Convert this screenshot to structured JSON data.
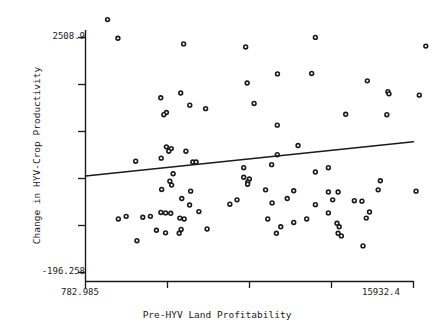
{
  "chart_data": {
    "type": "scatter",
    "title": "",
    "xlabel": "Pre-HYV Land Profitability",
    "ylabel": "Change in HYV-Crop Productivity",
    "xlim": [
      782.985,
      15932.4
    ],
    "ylim": [
      -196.258,
      2508.9
    ],
    "x_tick_labels": [
      "782.985",
      "15932.4"
    ],
    "y_tick_labels": [
      "2508.9",
      "-196.258"
    ],
    "x_ticks_values": [
      782.985,
      4570.34,
      8357.69,
      12145.05,
      15932.4
    ],
    "y_ticks_values": [
      2508.9,
      1958.6,
      1408.3,
      858.0,
      307.7,
      -196.258
    ],
    "grid": false,
    "legend": null,
    "marker": "open-circle",
    "marker_color": "#1a1a1a",
    "line_color": "#1a1a1a",
    "points": [
      [
        1800,
        2715
      ],
      [
        5315,
        2435
      ],
      [
        8180,
        2400
      ],
      [
        2280,
        2500
      ],
      [
        11400,
        2510
      ],
      [
        16500,
        2410
      ],
      [
        9650,
        2090
      ],
      [
        11230,
        2095
      ],
      [
        8250,
        1985
      ],
      [
        5180,
        1870
      ],
      [
        4260,
        1815
      ],
      [
        13800,
        2010
      ],
      [
        14750,
        1885
      ],
      [
        14800,
        1860
      ],
      [
        16200,
        1845
      ],
      [
        8570,
        1750
      ],
      [
        5600,
        1730
      ],
      [
        4520,
        1645
      ],
      [
        4400,
        1620
      ],
      [
        14700,
        1620
      ],
      [
        6330,
        1690
      ],
      [
        12800,
        1625
      ],
      [
        9640,
        1500
      ],
      [
        4520,
        1250
      ],
      [
        4745,
        1230
      ],
      [
        4630,
        1200
      ],
      [
        5420,
        1200
      ],
      [
        10600,
        1265
      ],
      [
        9640,
        1160
      ],
      [
        4280,
        1120
      ],
      [
        3100,
        1085
      ],
      [
        5740,
        1075
      ],
      [
        5890,
        1075
      ],
      [
        9380,
        1045
      ],
      [
        8090,
        1010
      ],
      [
        12000,
        1010
      ],
      [
        4830,
        940
      ],
      [
        11400,
        960
      ],
      [
        8090,
        900
      ],
      [
        8350,
        880
      ],
      [
        8280,
        845
      ],
      [
        8270,
        820
      ],
      [
        4680,
        855
      ],
      [
        4760,
        810
      ],
      [
        14400,
        860
      ],
      [
        4300,
        760
      ],
      [
        5640,
        740
      ],
      [
        9100,
        755
      ],
      [
        10400,
        745
      ],
      [
        12000,
        730
      ],
      [
        12450,
        730
      ],
      [
        14300,
        755
      ],
      [
        16050,
        740
      ],
      [
        7780,
        640
      ],
      [
        5230,
        655
      ],
      [
        10100,
        655
      ],
      [
        12200,
        640
      ],
      [
        13200,
        630
      ],
      [
        13550,
        625
      ],
      [
        9400,
        605
      ],
      [
        7450,
        590
      ],
      [
        5590,
        580
      ],
      [
        11400,
        585
      ],
      [
        6020,
        505
      ],
      [
        4265,
        495
      ],
      [
        4480,
        490
      ],
      [
        4720,
        485
      ],
      [
        12000,
        490
      ],
      [
        13900,
        500
      ],
      [
        2660,
        450
      ],
      [
        3430,
        440
      ],
      [
        3780,
        450
      ],
      [
        2300,
        420
      ],
      [
        5340,
        420
      ],
      [
        5140,
        430
      ],
      [
        9200,
        420
      ],
      [
        11000,
        420
      ],
      [
        13750,
        430
      ],
      [
        10400,
        380
      ],
      [
        12400,
        370
      ],
      [
        9800,
        330
      ],
      [
        12500,
        330
      ],
      [
        5200,
        300
      ],
      [
        6400,
        305
      ],
      [
        4060,
        290
      ],
      [
        4480,
        260
      ],
      [
        5110,
        255
      ],
      [
        9600,
        255
      ],
      [
        12450,
        255
      ],
      [
        12600,
        225
      ],
      [
        3160,
        170
      ],
      [
        13600,
        110
      ]
    ],
    "trendline": {
      "x0": 782.985,
      "y0": 915,
      "x1": 15932.4,
      "y1": 1310,
      "description": "least-squares fit, slight positive slope"
    }
  },
  "axes": {
    "y_top_label": "2508.9",
    "y_bottom_label": "-196.258",
    "x_left_label": "782.985",
    "x_right_label": "15932.4",
    "x_title": "Pre-HYV Land Profitability",
    "y_title": "Change in HYV-Crop Productivity"
  }
}
